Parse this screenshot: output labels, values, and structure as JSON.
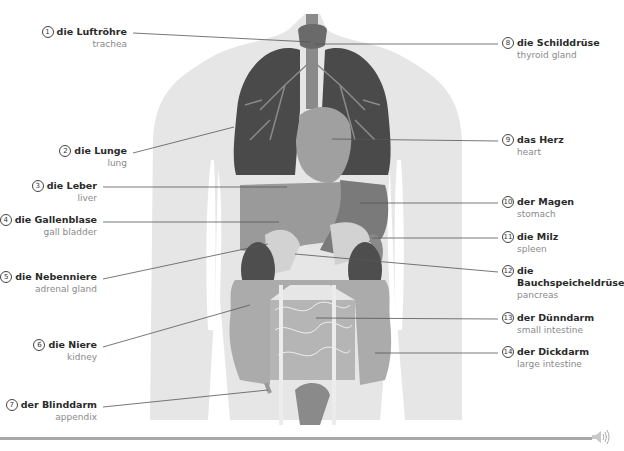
{
  "diagram": {
    "title_partial": "DIE ORGANE",
    "labels": [
      {
        "n": "1",
        "de": "die Luftröhre",
        "en": "trachea",
        "side": "left"
      },
      {
        "n": "2",
        "de": "die Lunge",
        "en": "lung",
        "side": "left"
      },
      {
        "n": "3",
        "de": "die Leber",
        "en": "liver",
        "side": "left"
      },
      {
        "n": "4",
        "de": "die Gallenblase",
        "en": "gall bladder",
        "side": "left"
      },
      {
        "n": "5",
        "de": "die Nebenniere",
        "en": "adrenal gland",
        "side": "left"
      },
      {
        "n": "6",
        "de": "die Niere",
        "en": "kidney",
        "side": "left"
      },
      {
        "n": "7",
        "de": "der Blinddarm",
        "en": "appendix",
        "side": "left"
      },
      {
        "n": "8",
        "de": "die Schilddrüse",
        "en": "thyroid gland",
        "side": "right"
      },
      {
        "n": "9",
        "de": "das Herz",
        "en": "heart",
        "side": "right"
      },
      {
        "n": "10",
        "de": "der Magen",
        "en": "stomach",
        "side": "right"
      },
      {
        "n": "11",
        "de": "die Milz",
        "en": "spleen",
        "side": "right"
      },
      {
        "n": "12",
        "de": "die",
        "de2": "Bauchspeicheldrüse",
        "en": "pancreas",
        "side": "right"
      },
      {
        "n": "13",
        "de": "der Dünndarm",
        "en": "small intestine",
        "side": "right"
      },
      {
        "n": "14",
        "de": "der Dickdarm",
        "en": "large intestine",
        "side": "right"
      }
    ],
    "colors": {
      "body": "#e6e6e6",
      "lung": "#4a4a4a",
      "organ_mid": "#9a9a9a",
      "organ_dark": "#6e6e6e",
      "intestine": "#ababab",
      "leader": "#555555"
    }
  },
  "footer": {
    "audio_icon": "speaker-icon"
  }
}
